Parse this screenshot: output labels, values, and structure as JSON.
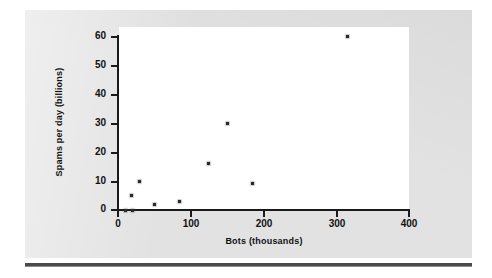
{
  "figure": {
    "background_color": "#e2e2e2",
    "plot_background_color": "#ffffff",
    "axis_color": "#1a1a1a",
    "point_color": "#2a2a2a"
  },
  "chart_data": {
    "type": "scatter",
    "title": "",
    "xlabel": "Bots (thousands)",
    "ylabel": "Spams per day (billions)",
    "xlim": [
      0,
      400
    ],
    "ylim": [
      0,
      62
    ],
    "xticks": [
      0,
      100,
      200,
      300,
      400
    ],
    "yticks": [
      0,
      10,
      20,
      30,
      40,
      50,
      60
    ],
    "xtick_labels": [
      "0",
      "100",
      "200",
      "300",
      "400"
    ],
    "ytick_labels": [
      "0",
      "10",
      "20",
      "30",
      "40",
      "50",
      "60"
    ],
    "grid": false,
    "legend": false,
    "points": [
      {
        "x": 10,
        "y": 0
      },
      {
        "x": 20,
        "y": 0
      },
      {
        "x": 18,
        "y": 5
      },
      {
        "x": 30,
        "y": 10
      },
      {
        "x": 50,
        "y": 2
      },
      {
        "x": 85,
        "y": 3
      },
      {
        "x": 125,
        "y": 16
      },
      {
        "x": 150,
        "y": 30
      },
      {
        "x": 185,
        "y": 9
      },
      {
        "x": 315,
        "y": 60
      }
    ]
  }
}
